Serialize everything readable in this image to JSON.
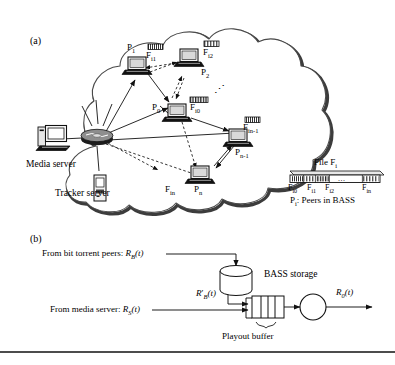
{
  "figure": {
    "panels": [
      {
        "id": "a",
        "label": "(a)"
      },
      {
        "id": "b",
        "label": "(b)"
      }
    ]
  },
  "panel_a": {
    "label": "(a)",
    "servers": [
      {
        "name": "media-server",
        "label": "Media server",
        "icon": "desktop-computer-icon"
      },
      {
        "name": "tracker-server",
        "label": "Tracker server",
        "icon": "server-tower-icon"
      }
    ],
    "hub": {
      "name": "network-hub",
      "icon": "network-hub-icon"
    },
    "peers": [
      {
        "id": "p0",
        "peer_label": "P",
        "peer_sub": "0",
        "chunk_label": "F",
        "chunk_sub": "i0",
        "icon": "laptop-icon"
      },
      {
        "id": "p1",
        "peer_label": "P",
        "peer_sub": "1",
        "chunk_label": "F",
        "chunk_sub": "i1",
        "icon": "laptop-icon"
      },
      {
        "id": "p2",
        "peer_label": "P",
        "peer_sub": "2",
        "chunk_label": "F",
        "chunk_sub": "i2",
        "icon": "laptop-icon"
      },
      {
        "id": "pn1",
        "peer_label": "P",
        "peer_sub": "n-1",
        "chunk_label": "F",
        "chunk_sub": "in-1",
        "icon": "laptop-icon"
      },
      {
        "id": "pn",
        "peer_label": "P",
        "peer_sub": "n",
        "chunk_label": "F",
        "chunk_sub": "in",
        "icon": "laptop-icon"
      }
    ],
    "ellipsis": "⋰",
    "legend": {
      "file_title": "File F",
      "file_title_sub": "i",
      "segments": [
        {
          "label": "F",
          "sub": "i0"
        },
        {
          "label": "F",
          "sub": "i1"
        },
        {
          "label": "F",
          "sub": "i2"
        },
        {
          "label": "F",
          "sub": "in"
        }
      ],
      "segment_ellipsis": "...",
      "peers_note_prefix": "P",
      "peers_note_sub": "i",
      "peers_note_suffix": ": Peers in BASS"
    }
  },
  "panel_b": {
    "label": "(b)",
    "inputs": [
      {
        "name": "bittorrent-input",
        "text": "From bit torrent peers: ",
        "sym": "R",
        "sym_sub": "B",
        "sym_arg": "(t)"
      },
      {
        "name": "media-server-input",
        "text": "From media server: ",
        "sym": "R",
        "sym_sub": "S",
        "sym_arg": "(t)"
      }
    ],
    "storage": {
      "name": "bass-storage",
      "label": "BASS storage",
      "icon": "cylinder-database-icon"
    },
    "storage_out": {
      "sym": "R",
      "prime": "′",
      "sym_sub": "B",
      "sym_arg": "(t)"
    },
    "buffer": {
      "name": "playout-buffer",
      "label": "Playout buffer",
      "segments": 4
    },
    "node": {
      "name": "summing-node",
      "icon": "circle-node-icon"
    },
    "output": {
      "sym": "R",
      "sym_sub": "0",
      "sym_arg": "(t)"
    }
  },
  "colors": {
    "ink": "#111111",
    "cloud_stroke": "#3a3a3a",
    "cloud_shadow": "#2b2b2b",
    "screen": "#d9d9d9"
  }
}
